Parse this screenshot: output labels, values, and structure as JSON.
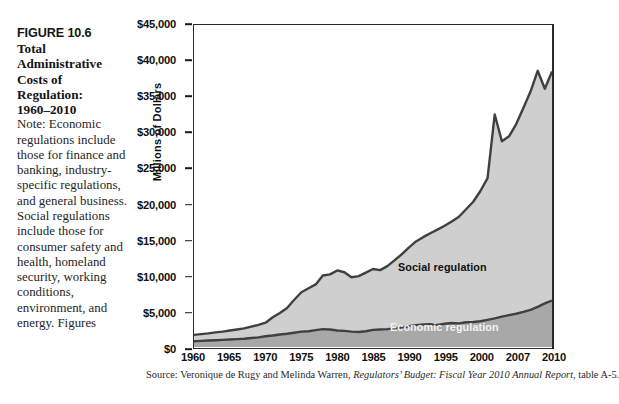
{
  "figure": {
    "number_line": "FIGURE 10.6",
    "title_lines": [
      "Total",
      "Administrative",
      "Costs of",
      "Regulation:",
      "1960–2010"
    ],
    "note": "Note: Economic regulations include those for finance and banking, industry-specific regulations, and general business. Social regulations include those for consumer safety and health, homeland security, working conditions, environment, and energy. Figures"
  },
  "source": {
    "prefix": "Source: Veronique de Rugy and Melinda Warren, ",
    "italic": "Regulators’ Budget: Fiscal Year 2010 Annual Report",
    "suffix": ", table A-5."
  },
  "colors": {
    "social_fill": "#cfcfcf",
    "economic_fill": "#a8a8a8",
    "line": "#404040",
    "axis": "#2b2b2b",
    "plot_bg": "#ffffff"
  },
  "chart_data": {
    "type": "area",
    "stacked": true,
    "title": "Total Administrative Costs of Regulation: 1960–2010",
    "xlabel": "",
    "ylabel": "Millions of Dollars",
    "ylim": [
      0,
      45000
    ],
    "ytick_labels": [
      "$0",
      "$5,000",
      "$10,000",
      "$15,000",
      "$20,000",
      "$25,000",
      "$30,000",
      "$35,000",
      "$40,000",
      "$45,000"
    ],
    "ytick_values": [
      0,
      5000,
      10000,
      15000,
      20000,
      25000,
      30000,
      35000,
      40000,
      45000
    ],
    "xtick_labels": [
      "1960",
      "1965",
      "1970",
      "1975",
      "1980",
      "1985",
      "1990",
      "1995",
      "2000",
      "2007",
      "2010"
    ],
    "xtick_values": [
      1960,
      1965,
      1970,
      1975,
      1980,
      1985,
      1990,
      1995,
      2000,
      2007,
      2010
    ],
    "grid": false,
    "legend": "inline-annotations",
    "annotations": [
      {
        "text": "Social regulation",
        "series": "Social regulation"
      },
      {
        "text": "Economic regulation",
        "series": "Economic regulation"
      }
    ],
    "x": [
      1960,
      1961,
      1962,
      1963,
      1964,
      1965,
      1966,
      1967,
      1968,
      1969,
      1970,
      1971,
      1972,
      1973,
      1974,
      1975,
      1976,
      1977,
      1978,
      1979,
      1980,
      1981,
      1982,
      1983,
      1984,
      1985,
      1986,
      1987,
      1988,
      1989,
      1990,
      1991,
      1992,
      1993,
      1994,
      1995,
      1996,
      1997,
      1998,
      1999,
      2000,
      2001,
      2002,
      2003,
      2004,
      2005,
      2006,
      2007,
      2008,
      2009,
      2010
    ],
    "series": [
      {
        "name": "Economic regulation",
        "values": [
          800,
          850,
          900,
          950,
          1000,
          1050,
          1100,
          1150,
          1250,
          1350,
          1500,
          1600,
          1750,
          1850,
          2000,
          2150,
          2200,
          2350,
          2500,
          2450,
          2300,
          2250,
          2150,
          2100,
          2200,
          2400,
          2450,
          2500,
          2600,
          2750,
          2900,
          3050,
          3150,
          3200,
          3100,
          3250,
          3350,
          3300,
          3450,
          3500,
          3600,
          3800,
          4000,
          4250,
          4450,
          4650,
          4900,
          5200,
          5600,
          6100,
          6500
        ]
      },
      {
        "name": "Social regulation",
        "values": [
          900,
          950,
          1000,
          1100,
          1150,
          1250,
          1350,
          1450,
          1600,
          1750,
          1900,
          2550,
          3000,
          3600,
          4600,
          5500,
          6000,
          6400,
          7500,
          7700,
          8400,
          8200,
          7600,
          7800,
          8200,
          8500,
          8300,
          8800,
          9500,
          10200,
          11000,
          11700,
          12200,
          12700,
          13300,
          13700,
          14200,
          14900,
          15800,
          16800,
          18200,
          19800,
          28500,
          24500,
          25000,
          26500,
          28500,
          30500,
          33000,
          30000,
          32000
        ]
      }
    ],
    "totals_note": "Values are stacked: plotted upper boundary = economic + social"
  }
}
